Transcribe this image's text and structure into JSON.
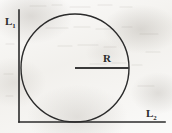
{
  "figure": {
    "background_color": "#f4f3f0",
    "ink_color": "#2b2b2b"
  },
  "labels": {
    "vertical_axis": {
      "letter": "L",
      "subscript": "1",
      "full": "L1"
    },
    "horizontal_axis": {
      "letter": "L",
      "subscript": "2",
      "full": "L2"
    },
    "radius": {
      "text": "R"
    }
  },
  "geometry": {
    "vertical_axis": {
      "x": 19,
      "y_top": 10,
      "y_bottom": 122,
      "stroke_width": 1.6
    },
    "horizontal_axis": {
      "y": 122,
      "x_left": 19,
      "x_right": 165,
      "stroke_width": 1.6
    },
    "circle": {
      "center_x": 75,
      "center_y": 68,
      "radius": 54,
      "stroke_width": 1.4,
      "fill": "none",
      "tangent_left_x": 21,
      "tangent_bottom_y": 122,
      "top_y": 14,
      "right_x": 129
    },
    "radius_segment": {
      "x1": 75,
      "y1": 68,
      "x2": 129,
      "y2": 68,
      "stroke_width": 2.2
    }
  }
}
